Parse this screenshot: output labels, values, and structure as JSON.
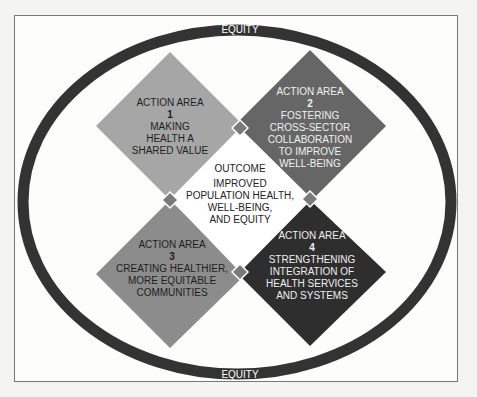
{
  "diagram": {
    "ring_label_top": "EQUITY",
    "ring_label_bottom": "EQUITY",
    "colors": {
      "ring": "#333333",
      "area1": "#a6a6a6",
      "area2": "#666666",
      "area3": "#8c8c8c",
      "area4": "#2e2e2e",
      "connector": "#7a7a7a",
      "outcome_text": "#222222"
    },
    "outcome": {
      "title": "OUTCOME",
      "lines": [
        "IMPROVED",
        "POPULATION HEALTH,",
        "WELL-BEING,",
        "AND EQUITY"
      ]
    },
    "action_areas": [
      {
        "heading": "ACTION AREA",
        "number": "1",
        "lines": [
          "MAKING",
          "HEALTH A",
          "SHARED VALUE"
        ]
      },
      {
        "heading": "ACTION AREA",
        "number": "2",
        "lines": [
          "FOSTERING",
          "CROSS-SECTOR",
          "COLLABORATION",
          "TO IMPROVE",
          "WELL-BEING"
        ]
      },
      {
        "heading": "ACTION AREA",
        "number": "3",
        "lines": [
          "CREATING HEALTHIER,",
          "MORE EQUITABLE",
          "COMMUNITIES"
        ]
      },
      {
        "heading": "ACTION AREA",
        "number": "4",
        "lines": [
          "STRENGTHENING",
          "INTEGRATION OF",
          "HEALTH SERVICES",
          "AND SYSTEMS"
        ]
      }
    ]
  }
}
